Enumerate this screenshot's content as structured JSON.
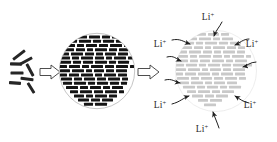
{
  "figure": {
    "title": "Schematic of nanorod assembly into microsphere and lithium ion insertion",
    "background_color": "#ffffff",
    "stages": [
      {
        "name": "precursor-nanorods",
        "description": "scattered dark nanorods",
        "rod_color": "#262626",
        "rod_count": 8
      },
      {
        "name": "assembled-microsphere",
        "description": "dense microsphere of packed dark nanorods",
        "rod_color": "#1a1a1a",
        "outline_color": "#b5b5b5",
        "center_x": 97,
        "center_y": 71,
        "radius": 38
      },
      {
        "name": "lithiated-microsphere",
        "description": "expanded light-gray microsphere accepting lithium ions",
        "rod_color": "#c9c9c9",
        "outline_color": "#e2e2e2",
        "center_x": 216,
        "center_y": 71,
        "radius": 41
      }
    ],
    "arrows": {
      "block_arrow_color_fill": "#ffffff",
      "block_arrow_color_stroke": "#3a3a3a",
      "block_arrow_labels": [
        "",
        ""
      ],
      "curved_arrow_color": "#1f1f1f"
    },
    "ion_labels": [
      {
        "id": "li-top",
        "text": "Li",
        "superscript": "+",
        "x": 208,
        "y": 20
      },
      {
        "id": "li-upper-left",
        "text": "Li",
        "superscript": "+",
        "x": 160,
        "y": 47
      },
      {
        "id": "li-upper-right",
        "text": "Li",
        "superscript": "+",
        "x": 252,
        "y": 47
      },
      {
        "id": "li-lower-left",
        "text": "Li",
        "superscript": "+",
        "x": 160,
        "y": 108
      },
      {
        "id": "li-lower-right",
        "text": "Li",
        "superscript": "+",
        "x": 250,
        "y": 108
      },
      {
        "id": "li-bottom",
        "text": "Li",
        "superscript": "+",
        "x": 202,
        "y": 132
      }
    ],
    "precursor_rods": [
      {
        "cx": 19,
        "cy": 55,
        "len": 15,
        "thick": 3.0,
        "angle": -38
      },
      {
        "cx": 26,
        "cy": 61,
        "len": 14,
        "thick": 3.0,
        "angle": -28
      },
      {
        "cx": 16,
        "cy": 64,
        "len": 12,
        "thick": 3.2,
        "angle": 2
      },
      {
        "cx": 30,
        "cy": 70,
        "len": 14,
        "thick": 3.0,
        "angle": 62
      },
      {
        "cx": 17,
        "cy": 73,
        "len": 13,
        "thick": 3.2,
        "angle": 0
      },
      {
        "cx": 27,
        "cy": 79,
        "len": 13,
        "thick": 3.0,
        "angle": 8
      },
      {
        "cx": 15,
        "cy": 83,
        "len": 12,
        "thick": 3.2,
        "angle": 4
      },
      {
        "cx": 31,
        "cy": 88,
        "len": 12,
        "thick": 3.0,
        "angle": 58
      }
    ]
  }
}
